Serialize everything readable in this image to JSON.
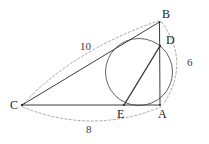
{
  "figure": {
    "background_color": "#ffffff",
    "stroke_color": "#4a4a4a",
    "solid_stroke_color": "#3c3c3c",
    "dashed_stroke_color": "#9a9a9a",
    "circle_stroke_color": "#555555",
    "width": 209,
    "height": 144,
    "points": [
      {
        "name": "B",
        "label": "B",
        "x": 159.5,
        "y": 22.0
      },
      {
        "name": "D",
        "label": "D",
        "x": 160.0,
        "y": 46.0
      },
      {
        "name": "A",
        "label": "A",
        "x": 160.0,
        "y": 105.0
      },
      {
        "name": "E",
        "label": "E",
        "x": 124.0,
        "y": 105.0
      },
      {
        "name": "C",
        "label": "C",
        "x": 22.0,
        "y": 105.0
      }
    ],
    "segments": [
      {
        "name": "CB",
        "from": "C",
        "to": "B",
        "style": "solid"
      },
      {
        "name": "CA",
        "from": "C",
        "to": "A",
        "style": "solid"
      },
      {
        "name": "BA",
        "from": "B",
        "to": "A",
        "style": "solid"
      },
      {
        "name": "ED",
        "from": "E",
        "to": "D",
        "style": "solid"
      }
    ],
    "circle": {
      "name": "inscribed-circle",
      "cx": 139.0,
      "cy": 72.0,
      "r": 33.5
    },
    "measures": [
      {
        "name": "CB",
        "label": "10",
        "arc": "C-to-B",
        "x": 80,
        "y": 41
      },
      {
        "name": "BA",
        "label": "6",
        "arc": "B-to-A",
        "x": 187,
        "y": 57
      },
      {
        "name": "CA",
        "label": "8",
        "arc": "C-to-A",
        "x": 86,
        "y": 124
      }
    ]
  }
}
